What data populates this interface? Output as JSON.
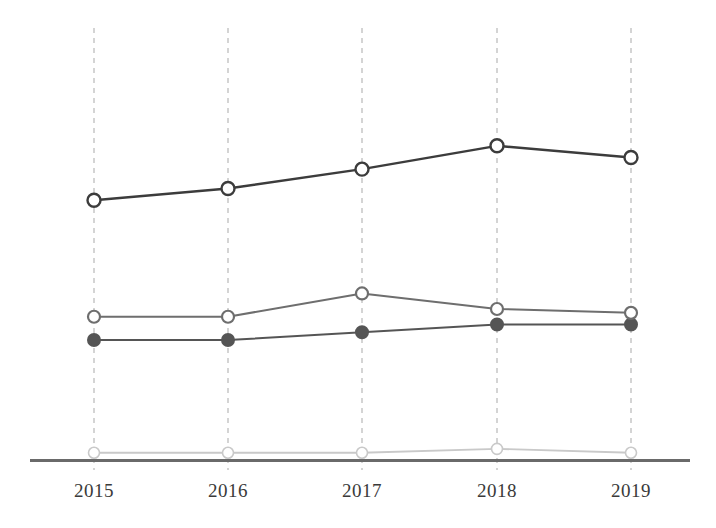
{
  "chart_data": {
    "type": "line",
    "title": "",
    "subtitle": "",
    "xlabel": "",
    "ylabel": "",
    "categories": [
      "2015",
      "2016",
      "2017",
      "2018",
      "2019"
    ],
    "grid": "vertical dashed gridlines at each category, no horizontal grid",
    "legend": "none",
    "legend_position": "none",
    "axis": {
      "x_axis_visible": true,
      "y_axis_visible": false,
      "y_ticks_visible": false,
      "ylim": [
        0,
        100
      ]
    },
    "series": [
      {
        "name": "series-1",
        "marker": "circle-open",
        "color": "#3c3c3c",
        "values": [
          67,
          70,
          75,
          81,
          78
        ]
      },
      {
        "name": "series-2",
        "marker": "circle-open",
        "color": "#6e6e6e",
        "values": [
          37,
          37,
          43,
          39,
          38
        ]
      },
      {
        "name": "series-3",
        "marker": "circle-filled",
        "color": "#555555",
        "values": [
          31,
          31,
          33,
          35,
          35
        ]
      },
      {
        "name": "series-4",
        "marker": "circle-open",
        "color": "#c9c9c9",
        "values": [
          2,
          2,
          2,
          3,
          2
        ]
      }
    ]
  },
  "axis_labels": {
    "ticks": [
      "2015",
      "2016",
      "2017",
      "2018",
      "2019"
    ]
  },
  "colors": {
    "series_1": "#3c3c3c",
    "series_2": "#6e6e6e",
    "series_3": "#555555",
    "series_4": "#c9c9c9",
    "gridline": "#bdbdbd",
    "axis": "#6a6a6a",
    "tick_text": "#3a3a3a",
    "background": "#ffffff",
    "marker_fill": "#ffffff"
  }
}
